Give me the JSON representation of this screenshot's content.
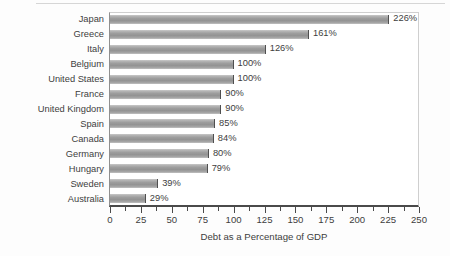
{
  "chart_data": {
    "type": "bar",
    "orientation": "horizontal",
    "title": "",
    "xlabel": "Debt as a Percentage of GDP",
    "ylabel": "",
    "xlim": [
      0,
      250
    ],
    "xticks": [
      0,
      25,
      50,
      75,
      100,
      125,
      150,
      175,
      200,
      225,
      250
    ],
    "xtick_labels": [
      "0",
      "25",
      "50",
      "75",
      "100",
      "125",
      "150",
      "175",
      "200",
      "225",
      "250"
    ],
    "minor_tick_step": 12.5,
    "grid": false,
    "legend": null,
    "value_suffix": "%",
    "categories": [
      "Japan",
      "Greece",
      "Italy",
      "Belgium",
      "United States",
      "France",
      "United Kingdom",
      "Spain",
      "Canada",
      "Germany",
      "Hungary",
      "Sweden",
      "Australia"
    ],
    "values": [
      226,
      161,
      126,
      100,
      100,
      90,
      90,
      85,
      84,
      80,
      79,
      39,
      29
    ],
    "data_labels": [
      "226%",
      "161%",
      "126%",
      "100%",
      "100%",
      "90%",
      "90%",
      "85%",
      "84%",
      "80%",
      "79%",
      "39%",
      "29%"
    ],
    "colors": {
      "bar_fill_light": "#c9c9c9",
      "bar_fill_mid": "#9d9d9d",
      "bar_fill_dark": "#939393",
      "bar_edge": "#4f4f4f",
      "axis": "#4a4a4a",
      "plot_border": "#cfcfcf",
      "text": "#3d3d3d",
      "background": "#fdfdfd"
    }
  }
}
